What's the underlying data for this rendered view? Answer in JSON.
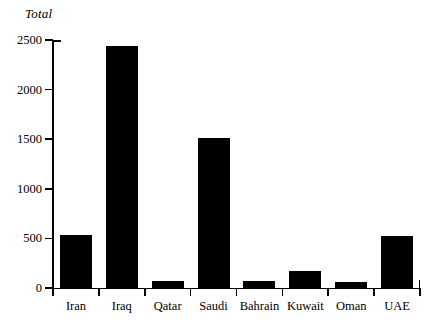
{
  "chart_data": {
    "type": "bar",
    "title": "",
    "ylabel": "Total",
    "xlabel": "",
    "categories": [
      "Iran",
      "Iraq",
      "Qatar",
      "Saudi",
      "Bahrain",
      "Kuwait",
      "Oman",
      "UAE"
    ],
    "values": [
      530,
      2440,
      70,
      1510,
      70,
      170,
      65,
      520
    ],
    "ylim": [
      0,
      2500
    ],
    "yticks": [
      0,
      500,
      1000,
      1500,
      2000,
      2500
    ],
    "ytick_labels": [
      "0",
      "500",
      "1000",
      "1500",
      "2000",
      "2500"
    ],
    "grid": false,
    "legend": null,
    "bar_color": "#000000",
    "background_color": "#ffffff",
    "axis_color": "#000000"
  },
  "axis": {
    "y_title": "Total"
  }
}
